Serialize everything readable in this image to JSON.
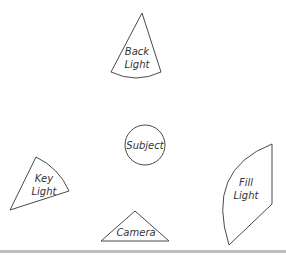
{
  "diagram": {
    "type": "three-point lighting setup",
    "elements": [
      {
        "id": "back_light",
        "label_line1": "Back",
        "label_line2": "Light",
        "shape": "cone"
      },
      {
        "id": "subject",
        "label": "Subject",
        "shape": "circle"
      },
      {
        "id": "key_light",
        "label_line1": "Key",
        "label_line2": "Light",
        "shape": "cone"
      },
      {
        "id": "fill_light",
        "label_line1": "Fill",
        "label_line2": "Light",
        "shape": "cone"
      },
      {
        "id": "camera",
        "label": "Camera",
        "shape": "triangle"
      }
    ]
  },
  "colors": {
    "stroke": "#4a4a4a",
    "text": "#333333",
    "background": "#ffffff",
    "baseline": "#bdbdbd"
  }
}
